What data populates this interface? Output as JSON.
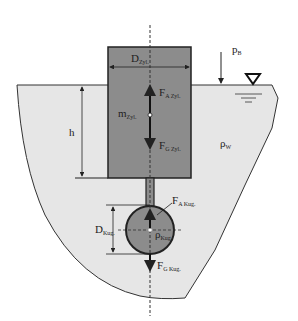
{
  "diagram": {
    "title": "",
    "colors": {
      "background": "#ffffff",
      "water": "#e6e6e6",
      "cylinder": "#8c8c8c",
      "sphere": "#8c8c8c",
      "outline": "#222222"
    },
    "labels": {
      "cylinder_diameter": {
        "main": "D",
        "sub": "Zyl."
      },
      "ambient_pressure": {
        "main": "p",
        "sub": "B"
      },
      "cylinder_buoyancy": {
        "main": "F",
        "sub": "A Zyl."
      },
      "cylinder_mass": {
        "main": "m",
        "sub": "Zyl."
      },
      "depth": {
        "main": "h",
        "sub": ""
      },
      "water_density": {
        "main": "ρ",
        "sub": "W"
      },
      "cylinder_weight": {
        "main": "F",
        "sub": "G Zyl."
      },
      "sphere_buoyancy": {
        "main": "F",
        "sub": "A Kug."
      },
      "sphere_diameter": {
        "main": "D",
        "sub": "Kug."
      },
      "sphere_density": {
        "main": "ρ",
        "sub": "Kug."
      },
      "sphere_weight": {
        "main": "F",
        "sub": "G Kug."
      }
    },
    "symbols": {
      "water_level": "free-surface-triangle"
    }
  }
}
